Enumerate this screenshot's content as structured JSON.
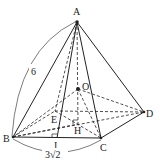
{
  "diagram": {
    "type": "pyramid",
    "points": {
      "A": {
        "label": "A",
        "x": 77,
        "y": 22
      },
      "O": {
        "label": "O",
        "x": 78,
        "y": 89
      },
      "B": {
        "label": "B",
        "x": 13,
        "y": 137
      },
      "C": {
        "label": "C",
        "x": 101,
        "y": 138
      },
      "D": {
        "label": "D",
        "x": 144,
        "y": 112
      },
      "E": {
        "label": "E",
        "x": 55,
        "y": 111
      },
      "H": {
        "label": "H",
        "x": 78,
        "y": 124
      },
      "I": {
        "label": "I",
        "x": 57,
        "y": 138
      }
    },
    "measurements": {
      "AB": "6",
      "BC": "3√2"
    }
  }
}
